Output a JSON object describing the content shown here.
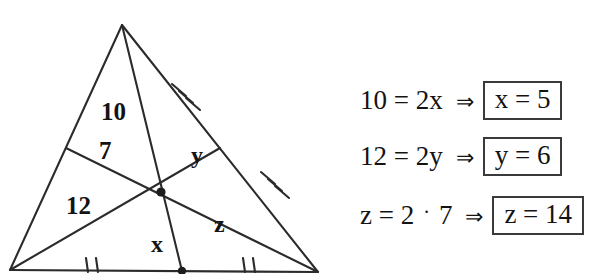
{
  "figure": {
    "stroke_color": "#2b2b2b",
    "labels": {
      "seg_10": "10",
      "seg_7": "7",
      "seg_12": "12",
      "seg_x": "x",
      "seg_y": "y",
      "seg_z": "z"
    },
    "tick_marks": {
      "right_side_upper": 3,
      "right_side_lower": 3,
      "bottom_left": 2,
      "bottom_right": 2
    }
  },
  "equations": {
    "rows": [
      {
        "lhs": "10 = 2x",
        "arrow": "⇒",
        "result": "x = 5",
        "boxed": true
      },
      {
        "lhs": "12 = 2y",
        "arrow": "⇒",
        "result": "y = 6",
        "boxed": true
      },
      {
        "lhs_a": "z = 2",
        "operator": "·",
        "lhs_b": "7",
        "arrow": "⇒",
        "result": "z = 14",
        "boxed": true
      }
    ]
  }
}
